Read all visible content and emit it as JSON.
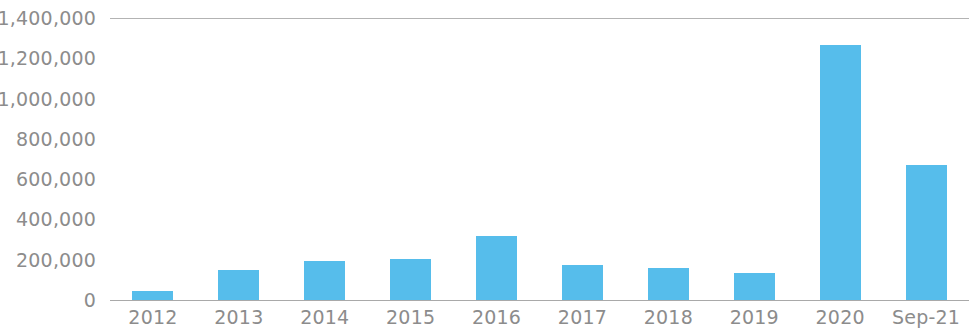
{
  "chart_data": {
    "type": "bar",
    "title": "",
    "subtitle": "",
    "xlabel": "",
    "ylabel": "",
    "categories": [
      "2012",
      "2013",
      "2014",
      "2015",
      "2016",
      "2017",
      "2018",
      "2019",
      "2020",
      "Sep-21"
    ],
    "values": [
      45000,
      149000,
      195000,
      203000,
      320000,
      173000,
      157000,
      134000,
      1265000,
      668000
    ],
    "ylim": [
      0,
      1400000
    ],
    "y_ticks": [
      0,
      200000,
      400000,
      600000,
      800000,
      1000000,
      1200000,
      1400000
    ],
    "y_tick_labels": [
      "0",
      "200,000",
      "400,000",
      "600,000",
      "800,000",
      "1,000,000",
      "1,200,000",
      "1,400,000"
    ],
    "grid": "top-only",
    "gridlines_at": [
      1400000
    ],
    "legend": null,
    "legend_position": "none",
    "bar_color": "#56bdeb",
    "axis_color": "#9a9a9a",
    "label_color": "#8c8c8c",
    "background_color": "#ffffff",
    "series": [
      {
        "name": "",
        "values": [
          45000,
          149000,
          195000,
          203000,
          320000,
          173000,
          157000,
          134000,
          1265000,
          668000
        ]
      }
    ]
  }
}
